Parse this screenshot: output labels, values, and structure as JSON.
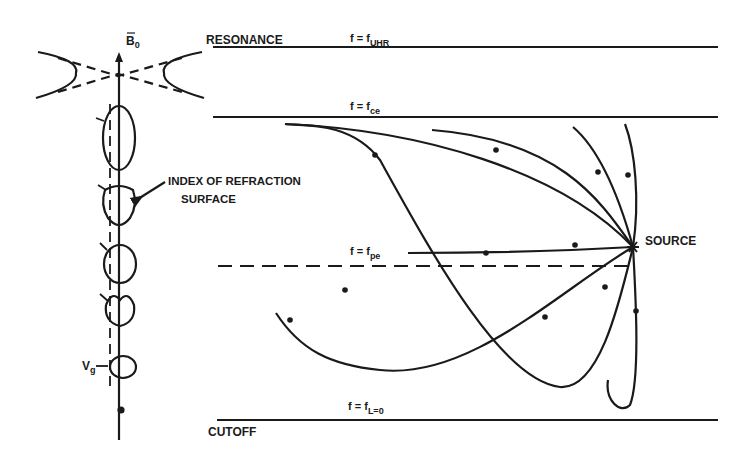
{
  "diagram": {
    "type": "ray-path diagram",
    "colors": {
      "ink": "#1a1a1a",
      "background": "#ffffff"
    },
    "labels": {
      "resonance": "RESONANCE",
      "cutoff": "CUTOFF",
      "source": "SOURCE",
      "index_surface_line1": "INDEX OF REFRACTION",
      "index_surface_line2": "SURFACE",
      "b0": "B",
      "b0_sub": "0",
      "vg": "V",
      "vg_sub": "g"
    },
    "levels": [
      {
        "id": "uhr",
        "label": "f = f",
        "sub": "UHR",
        "style": "solid"
      },
      {
        "id": "ce",
        "label": "f = f",
        "sub": "ce",
        "style": "solid"
      },
      {
        "id": "pe",
        "label": "f = f",
        "sub": "pe",
        "style": "dashed"
      },
      {
        "id": "l0",
        "label": "f = f",
        "sub": "L=0",
        "style": "solid"
      }
    ],
    "index_surfaces_count": 5,
    "ray_count": 8
  }
}
